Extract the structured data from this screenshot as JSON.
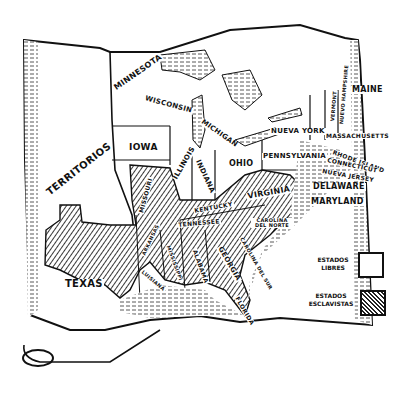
{
  "map": {
    "free_states": [
      "MINNESOTA",
      "WISCONSIN",
      "IOWA",
      "ILLINOIS",
      "INDIANA",
      "MICHIGAN",
      "OHIO",
      "PENNSYLVANIA",
      "NUEVA YORK",
      "VERMONT",
      "NUEVO HAMPSHIRE",
      "MAINE",
      "MASSACHUSETTS",
      "RHODE ISLAND",
      "CONNECTICUT",
      "NUEVA JERSEY"
    ],
    "slave_states": [
      "MISSOURI",
      "KENTUCKY",
      "VIRGINIA",
      "DELAWARE",
      "MARYLAND",
      "TENNESSEE",
      "CAROLINA DEL NORTE",
      "CAROLINA DEL SUR",
      "GEORGIA",
      "ALABAMA",
      "MISSISSIPPI",
      "ARKANSAS",
      "LUISIANA",
      "FLORIDA",
      "TEXAS"
    ],
    "labels": {
      "territorios": "TERRITORIOS",
      "minnesota": "MINNESOTA",
      "wisconsin": "WISCONSIN",
      "iowa": "IOWA",
      "illinois": "ILLINOIS",
      "indiana": "INDIANA",
      "michigan": "MICHIGAN",
      "ohio": "OHIO",
      "pennsylvania": "PENNSYLVANIA",
      "nueva_york": "NUEVA YORK",
      "vermont": "VERMONT",
      "nuevo_hampshire": "NUEVO HAMPSHIRE",
      "maine": "MAINE",
      "massachusetts": "MASSACHUSETTS",
      "rhode_island": "RHODE ISLAND",
      "connecticut": "CONNECTICUT",
      "nueva_jersey": "NUEVA JERSEY",
      "delaware": "DELAWARE",
      "maryland": "MARYLAND",
      "missouri": "MISSOURI",
      "kentucky": "KENTUCKY",
      "virginia": "VIRGINIA",
      "tennessee": "TENNESSEE",
      "carolina_norte": "CAROLINA DEL NORTE",
      "carolina_sur": "CAROLINA DEL SUR",
      "georgia": "GEORGIA",
      "alabama": "ALABAMA",
      "mississippi": "MISSISSIPPI",
      "arkansas": "ARKANSAS",
      "luisiana": "LUISIANA",
      "florida": "FLORIDA",
      "texas": "TEXAS"
    }
  },
  "legend": {
    "free_line1": "ESTADOS",
    "free_line2": "LIBRES",
    "slave_line1": "ESTADOS",
    "slave_line2": "ESCLAVISTAS"
  },
  "colors": {
    "ink": "#111111",
    "paper": "#ffffff"
  }
}
